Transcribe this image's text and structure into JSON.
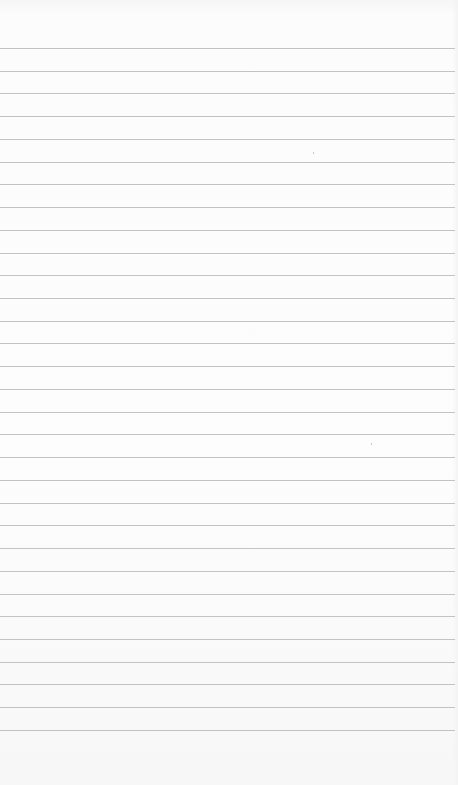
{
  "image": {
    "description": "Blank sheet of white lined paper",
    "background_color": "#fcfcfc",
    "rule_color": "#b9b9b9",
    "rule_count": 31,
    "first_rule_y": 48,
    "rule_spacing_px": 22.73
  }
}
